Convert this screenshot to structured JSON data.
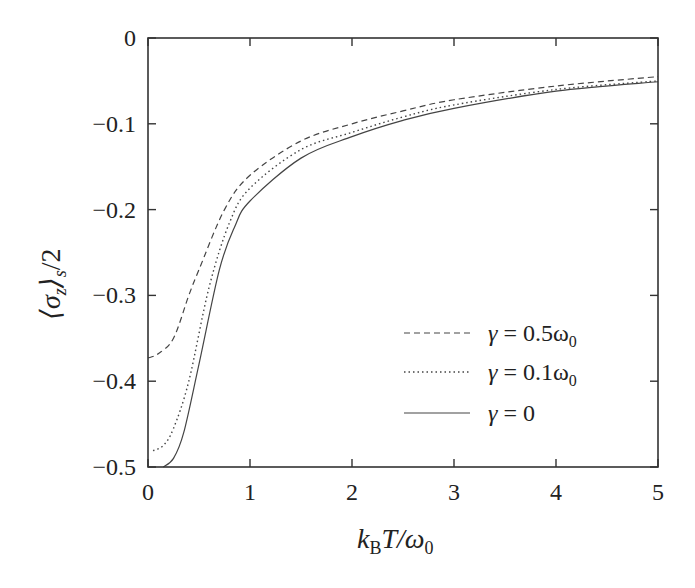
{
  "chart_data": {
    "type": "line",
    "title": "",
    "xlabel": "k_B T / ω_0",
    "ylabel": "⟨σ_z⟩_s / 2",
    "xlim": [
      0,
      5
    ],
    "ylim": [
      -0.5,
      0
    ],
    "xticks": [
      "0",
      "1",
      "2",
      "3",
      "4",
      "5"
    ],
    "yticks": [
      "0",
      "-0.1",
      "-0.2",
      "-0.3",
      "-0.4",
      "-0.5"
    ],
    "grid": false,
    "legend_position": "lower right",
    "series": [
      {
        "name": "γ = 0.5ω₀",
        "style": "dashed",
        "x": [
          0,
          0.1,
          0.25,
          0.4,
          0.5,
          0.75,
          1,
          1.5,
          2,
          2.5,
          3,
          4,
          5
        ],
        "y": [
          -0.373,
          -0.368,
          -0.35,
          -0.3,
          -0.27,
          -0.2,
          -0.16,
          -0.12,
          -0.1,
          -0.085,
          -0.072,
          -0.056,
          -0.045
        ]
      },
      {
        "name": "γ = 0.1ω₀",
        "style": "dotted",
        "x": [
          0.05,
          0.15,
          0.25,
          0.4,
          0.6,
          0.8,
          1,
          1.5,
          2,
          2.5,
          3,
          4,
          5
        ],
        "y": [
          -0.481,
          -0.475,
          -0.455,
          -0.4,
          -0.29,
          -0.215,
          -0.175,
          -0.13,
          -0.11,
          -0.092,
          -0.078,
          -0.06,
          -0.05
        ]
      },
      {
        "name": "γ = 0",
        "style": "solid",
        "x": [
          0.15,
          0.25,
          0.35,
          0.5,
          0.7,
          0.85,
          1,
          1.5,
          2,
          2.5,
          3,
          4,
          5
        ],
        "y": [
          -0.5,
          -0.49,
          -0.46,
          -0.38,
          -0.27,
          -0.22,
          -0.19,
          -0.14,
          -0.115,
          -0.096,
          -0.082,
          -0.062,
          -0.051
        ]
      }
    ]
  },
  "axes": {
    "xlabel_parts": {
      "k": "k",
      "sub": "B",
      "rest": "T/ω",
      "sub2": "0"
    },
    "ylabel_parts": {
      "open": "⟨σ",
      "sub": "z",
      "close": "⟩",
      "sub2": "s",
      "rest": "/2"
    }
  },
  "legend": [
    {
      "prefix": "γ = ",
      "value": "0.5ω",
      "sub": "0"
    },
    {
      "prefix": "γ = ",
      "value": "0.1ω",
      "sub": "0"
    },
    {
      "prefix": "γ = ",
      "value": "0",
      "sub": ""
    }
  ]
}
